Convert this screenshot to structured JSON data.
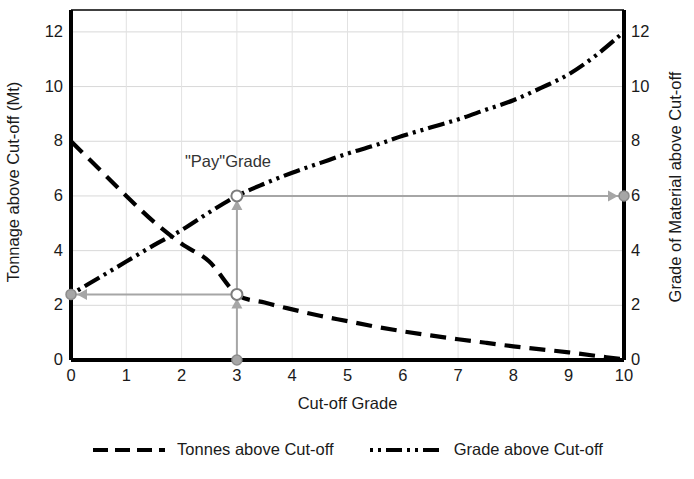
{
  "chart_data": {
    "type": "line",
    "title": "",
    "xlabel": "Cut-off Grade",
    "ylabel": "Tonnage above Cut-off (Mt)",
    "ylabel_right": "Grade of Material above Cut-off",
    "xlim": [
      0,
      10
    ],
    "ylim": [
      0,
      12.8
    ],
    "ylim_right": [
      0,
      12.8
    ],
    "grid": true,
    "legend_position": "bottom-center",
    "xticks": [
      "0",
      "1",
      "2",
      "3",
      "4",
      "5",
      "6",
      "7",
      "8",
      "9",
      "10"
    ],
    "yticks": [
      "0",
      "2",
      "4",
      "6",
      "8",
      "10",
      "12"
    ],
    "yticks_right": [
      "0",
      "2",
      "4",
      "6",
      "8",
      "10",
      "12"
    ],
    "x": [
      0,
      0.5,
      1,
      1.5,
      2,
      2.5,
      3,
      3.5,
      4,
      4.5,
      5,
      5.5,
      6,
      6.5,
      7,
      7.5,
      8,
      8.5,
      9,
      9.5,
      10
    ],
    "series": [
      {
        "name": "Tonnes above Cut-off",
        "axis": "left",
        "style": "dashed",
        "color": "#000000",
        "values": [
          8.0,
          7.0,
          6.0,
          5.05,
          4.25,
          3.6,
          2.4,
          2.1,
          1.85,
          1.62,
          1.42,
          1.22,
          1.05,
          0.9,
          0.76,
          0.63,
          0.5,
          0.39,
          0.28,
          0.15,
          0.02
        ]
      },
      {
        "name": "Grade above Cut-off",
        "axis": "right",
        "style": "dash-dot-dot",
        "color": "#000000",
        "values": [
          2.4,
          3.0,
          3.6,
          4.2,
          4.75,
          5.4,
          6.0,
          6.45,
          6.85,
          7.2,
          7.55,
          7.85,
          8.2,
          8.5,
          8.8,
          9.15,
          9.5,
          9.95,
          10.45,
          11.15,
          12.0
        ]
      }
    ],
    "annotations": [
      {
        "label": "\"Pay\"Grade",
        "cutoff_x": 3,
        "tonnes_at_cutoff": 2.4,
        "grade_at_cutoff": 6.0,
        "color": "#a6a6a6"
      }
    ]
  },
  "legend": {
    "entries": [
      {
        "label": "Tonnes above Cut-off",
        "style": "dashed"
      },
      {
        "label": "Grade above Cut-off",
        "style": "dash-dot-dot"
      }
    ]
  },
  "axes": {
    "x_title": "Cut-off Grade",
    "y_left_title": "Tonnage above Cut-off (Mt)",
    "y_right_title": "Grade of Material above Cut-off"
  }
}
